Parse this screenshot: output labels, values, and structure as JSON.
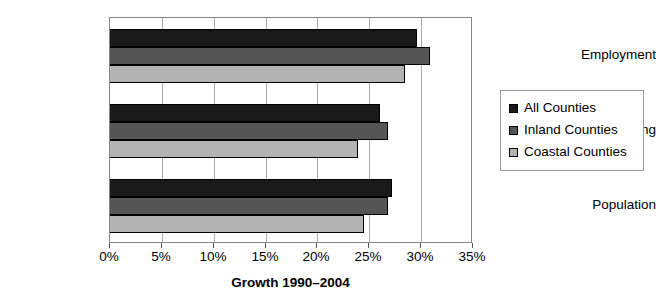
{
  "chart_data": {
    "type": "bar",
    "orientation": "horizontal",
    "title": "",
    "subtitle": "",
    "xlabel": "Growth 1990–2004",
    "ylabel": "",
    "categories": [
      "Employment",
      "Housing",
      "Population"
    ],
    "series": [
      {
        "name": "All Counties",
        "color": "#1a1a1a",
        "values": [
          29.6,
          26.0,
          27.2
        ]
      },
      {
        "name": "Inland Counties",
        "color": "#555555",
        "values": [
          30.9,
          26.8,
          26.8
        ]
      },
      {
        "name": "Coastal Counties",
        "color": "#b3b3b3",
        "values": [
          28.4,
          23.9,
          24.5
        ]
      }
    ],
    "xlim": [
      0,
      35
    ],
    "xticks": [
      0,
      5,
      10,
      15,
      20,
      25,
      30,
      35
    ],
    "xtick_labels": [
      "0%",
      "5%",
      "10%",
      "15%",
      "20%",
      "25%",
      "30%",
      "35%"
    ],
    "grid": {
      "vertical": true,
      "horizontal": false
    },
    "legend": {
      "position": "right",
      "border": true
    },
    "value_unit": "percent"
  },
  "axis": {
    "x_title": "Growth 1990–2004"
  },
  "legend": {
    "items": [
      {
        "label": "All Counties"
      },
      {
        "label": "Inland Counties"
      },
      {
        "label": "Coastal Counties"
      }
    ]
  }
}
